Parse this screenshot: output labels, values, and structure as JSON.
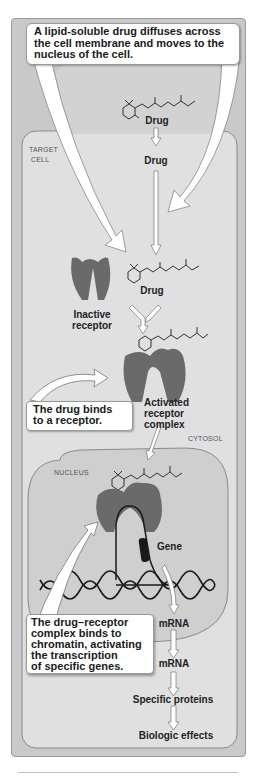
{
  "figure": {
    "top_callout": "A lipid-soluble drug diffuses across the cell membrane and moves to the nucleus of the cell.",
    "region_labels": {
      "target_cell_line1": "TARGET",
      "target_cell_line2": "CELL",
      "cytosol": "CYTOSOL",
      "nucleus": "NUCLEUS"
    },
    "labels": {
      "drug_outside": "Drug",
      "drug_membrane": "Drug",
      "drug_cytosol": "Drug",
      "inactive_receptor_line1": "Inactive",
      "inactive_receptor_line2": "receptor",
      "activated_line1": "Activated",
      "activated_line2": "receptor",
      "activated_line3": "complex",
      "gene": "Gene",
      "mrna_nucleus": "mRNA",
      "mrna_cytosol": "mRNA",
      "specific_proteins": "Specific proteins",
      "biologic_effects": "Biologic effects"
    },
    "binds_callout_line1": "The drug binds",
    "binds_callout_line2": "to a receptor.",
    "chromatin_callout": [
      "The drug–receptor",
      "complex binds to",
      "chromatin, activating",
      "the transcription",
      "of specific genes."
    ],
    "colors": {
      "outer_frame": "#c9c9c9",
      "cell_fill": "#e0e0e0",
      "nucleus_fill": "#cfcfcf",
      "receptor": "#6a6a6a",
      "callout_bg": "#ffffff",
      "dna": "#1a1a1a"
    }
  }
}
